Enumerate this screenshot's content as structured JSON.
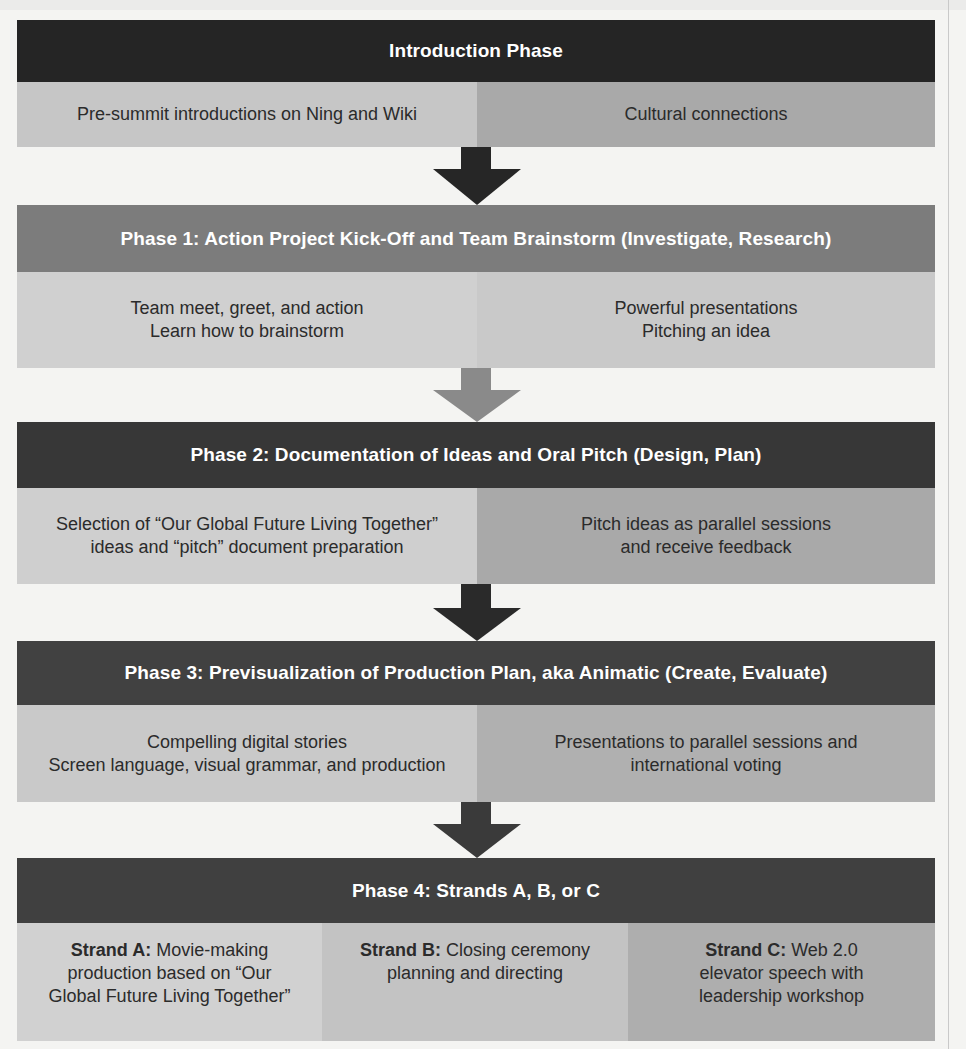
{
  "figure": {
    "colors": {
      "dark_header": "#252525",
      "phase1_header": "#7c7c7c",
      "phase2_header": "#373737",
      "phase3_header": "#414141",
      "phase4_header": "#404040",
      "arrow_dark": "#262626",
      "arrow_gray": "#8a8a8a",
      "page_bg": "#f4f4f2"
    },
    "intro": {
      "title": "Introduction Phase",
      "cells": [
        {
          "text": "Pre-summit introductions on Ning and Wiki"
        },
        {
          "text": "Cultural connections"
        }
      ]
    },
    "phase1": {
      "title": "Phase 1: Action Project Kick-Off and Team Brainstorm (Investigate, Research)",
      "cells": [
        {
          "lines": [
            "Team meet, greet, and action",
            "Learn how to brainstorm"
          ]
        },
        {
          "lines": [
            "Powerful presentations",
            "Pitching an idea"
          ]
        }
      ]
    },
    "phase2": {
      "title": "Phase 2: Documentation of Ideas and Oral Pitch (Design, Plan)",
      "cells": [
        {
          "lines": [
            "Selection of “Our Global Future Living Together”",
            "ideas and “pitch” document preparation"
          ]
        },
        {
          "lines": [
            "Pitch ideas as parallel sessions",
            "and receive feedback"
          ]
        }
      ]
    },
    "phase3": {
      "title": "Phase 3: Previsualization of Production Plan, aka Animatic (Create, Evaluate)",
      "cells": [
        {
          "lines": [
            "Compelling digital stories",
            "Screen language, visual grammar, and production"
          ]
        },
        {
          "lines": [
            "Presentations to parallel sessions and",
            "international voting"
          ]
        }
      ]
    },
    "phase4": {
      "title": "Phase 4: Strands A, B, or C",
      "strands": [
        {
          "label": "Strand A:",
          "lines": [
            "Movie-making",
            "production based on “Our",
            "Global Future Living Together”"
          ]
        },
        {
          "label": "Strand B:",
          "lines": [
            "Closing ceremony",
            "planning and directing"
          ]
        },
        {
          "label": "Strand C:",
          "lines": [
            "Web 2.0",
            "elevator speech with",
            "leadership workshop"
          ]
        }
      ]
    },
    "arrows": [
      {
        "icon": "down-arrow-icon",
        "shade": "dark"
      },
      {
        "icon": "down-arrow-icon",
        "shade": "gray"
      },
      {
        "icon": "down-arrow-icon",
        "shade": "dark"
      },
      {
        "icon": "down-arrow-icon",
        "shade": "dark"
      }
    ]
  }
}
